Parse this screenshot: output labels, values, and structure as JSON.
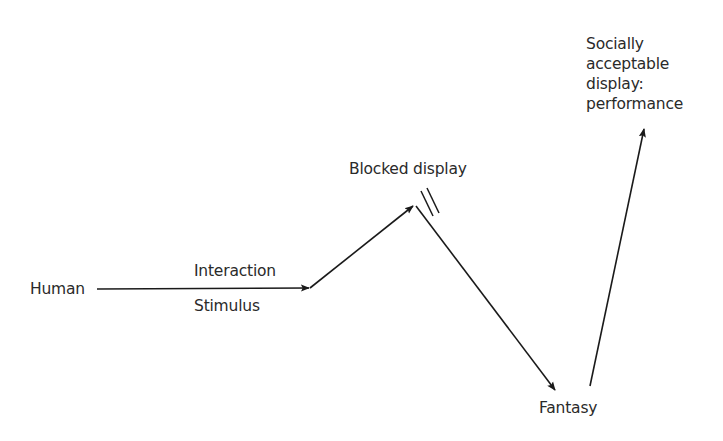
{
  "diagram": {
    "nodes": {
      "human": "Human",
      "interaction": "Interaction",
      "stimulus": "Stimulus",
      "blocked": "Blocked display",
      "fantasy": "Fantasy",
      "social_line1": "Socially",
      "social_line2": "acceptable",
      "social_line3": "display:",
      "social_line4": "performance"
    },
    "edges": [
      {
        "from": "Human",
        "to": "Interaction/Stimulus point",
        "type": "arrow"
      },
      {
        "from": "Interaction/Stimulus point",
        "to": "Blocked display",
        "type": "arrow"
      },
      {
        "from": "Blocked display",
        "to": "Fantasy",
        "type": "arrow"
      },
      {
        "from": "Fantasy",
        "to": "Socially acceptable display: performance",
        "type": "arrow"
      }
    ],
    "colors": {
      "line": "#1a1a1a",
      "text": "#2a2a2a",
      "background": "#ffffff"
    }
  }
}
